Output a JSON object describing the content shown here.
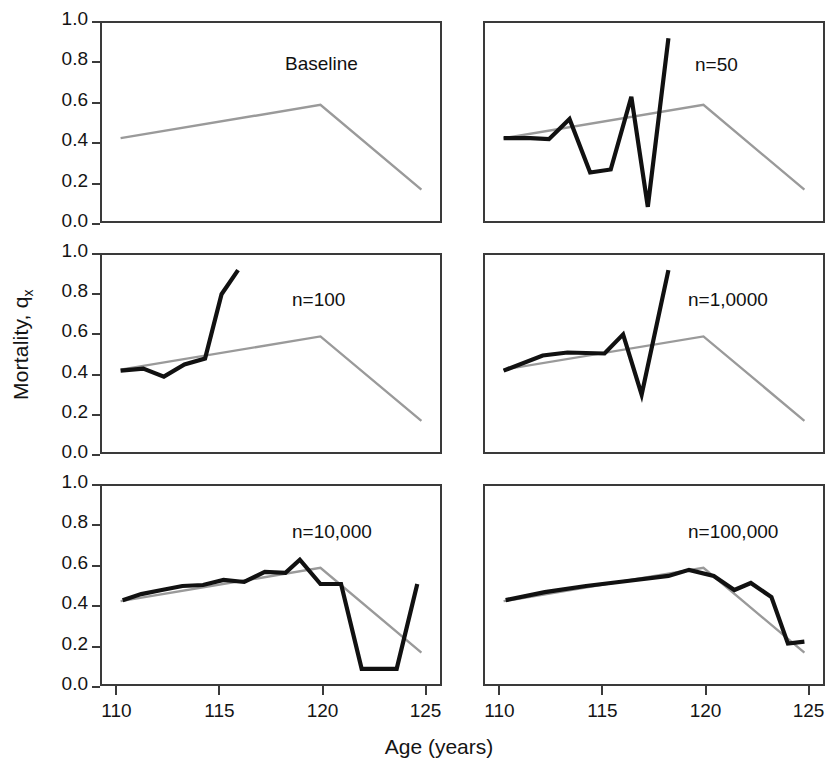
{
  "figure": {
    "xlabel": "Age (years)",
    "ylabel_main": "Mortality, q",
    "ylabel_sub": "x",
    "baseline_color": "#9a9a9a",
    "simulated_color": "#111111",
    "frame_color": "#3a3a3a",
    "background": "#ffffff"
  },
  "axes": {
    "xlim": [
      109.2,
      125.8
    ],
    "ylim": [
      0.0,
      1.0
    ],
    "xticks": [
      110,
      115,
      120,
      125
    ],
    "xtick_labels": [
      "110",
      "115",
      "120",
      "125"
    ],
    "yticks": [
      0.0,
      0.2,
      0.4,
      0.6,
      0.8,
      1.0
    ],
    "ytick_labels": [
      "0.0",
      "0.2",
      "0.4",
      "0.6",
      "0.8",
      "1.0"
    ],
    "grid": false
  },
  "chart_data": {
    "type": "line",
    "title": "",
    "xlabel": "Age (years)",
    "ylabel": "Mortality, qx",
    "xlim": [
      109.2,
      125.8
    ],
    "ylim": [
      0.0,
      1.0
    ],
    "legend_position": "none",
    "shared_baseline": {
      "name": "Baseline",
      "color": "#9a9a9a",
      "x": [
        110.2,
        119.9,
        124.8
      ],
      "y": [
        0.42,
        0.585,
        0.165
      ]
    },
    "panels": [
      {
        "id": "baseline",
        "label": "Baseline",
        "row": 1,
        "col": 1,
        "label_x_frac": 0.54,
        "label_y_frac": 0.16,
        "series": [
          {
            "name": "Baseline",
            "color": "#9a9a9a",
            "x": [
              110.2,
              119.9,
              124.8
            ],
            "y": [
              0.42,
              0.585,
              0.165
            ]
          }
        ]
      },
      {
        "id": "n50",
        "label": "n=50",
        "row": 1,
        "col": 2,
        "label_x_frac": 0.62,
        "label_y_frac": 0.165,
        "series": [
          {
            "name": "Baseline",
            "color": "#9a9a9a",
            "x": [
              110.2,
              119.9,
              124.8
            ],
            "y": [
              0.42,
              0.585,
              0.165
            ]
          },
          {
            "name": "Simulated",
            "color": "#111111",
            "x": [
              110.2,
              111.5,
              112.4,
              113.4,
              114.4,
              115.4,
              116.4,
              117.2,
              118.2
            ],
            "y": [
              0.42,
              0.42,
              0.415,
              0.515,
              0.25,
              0.265,
              0.625,
              0.08,
              0.915
            ]
          }
        ]
      },
      {
        "id": "n100",
        "label": "n=100",
        "row": 2,
        "col": 1,
        "label_x_frac": 0.56,
        "label_y_frac": 0.18,
        "series": [
          {
            "name": "Baseline",
            "color": "#9a9a9a",
            "x": [
              110.2,
              119.9,
              124.8
            ],
            "y": [
              0.42,
              0.585,
              0.165
            ]
          },
          {
            "name": "Simulated",
            "color": "#111111",
            "x": [
              110.2,
              111.3,
              112.3,
              113.3,
              114.3,
              115.1,
              115.9
            ],
            "y": [
              0.415,
              0.425,
              0.385,
              0.445,
              0.475,
              0.795,
              0.915
            ]
          }
        ]
      },
      {
        "id": "n10000-typo",
        "label": "n=1,0000",
        "row": 2,
        "col": 2,
        "label_x_frac": 0.6,
        "label_y_frac": 0.18,
        "series": [
          {
            "name": "Baseline",
            "color": "#9a9a9a",
            "x": [
              110.2,
              119.9,
              124.8
            ],
            "y": [
              0.42,
              0.585,
              0.165
            ]
          },
          {
            "name": "Simulated",
            "color": "#111111",
            "x": [
              110.2,
              112.1,
              113.3,
              115.1,
              116.0,
              116.9,
              118.2
            ],
            "y": [
              0.415,
              0.49,
              0.505,
              0.5,
              0.595,
              0.295,
              0.915
            ]
          }
        ]
      },
      {
        "id": "n10000",
        "label": "n=10,000",
        "row": 3,
        "col": 1,
        "label_x_frac": 0.56,
        "label_y_frac": 0.185,
        "series": [
          {
            "name": "Baseline",
            "color": "#9a9a9a",
            "x": [
              110.2,
              119.9,
              124.8
            ],
            "y": [
              0.42,
              0.585,
              0.165
            ]
          },
          {
            "name": "Simulated",
            "color": "#111111",
            "x": [
              110.3,
              111.2,
              112.2,
              113.2,
              114.2,
              115.2,
              116.2,
              117.2,
              118.2,
              118.9,
              119.9,
              120.9,
              121.9,
              123.6,
              124.6
            ],
            "y": [
              0.425,
              0.455,
              0.475,
              0.495,
              0.5,
              0.525,
              0.515,
              0.565,
              0.56,
              0.625,
              0.505,
              0.505,
              0.085,
              0.085,
              0.505
            ]
          }
        ]
      },
      {
        "id": "n100000",
        "label": "n=100,000",
        "row": 3,
        "col": 2,
        "label_x_frac": 0.6,
        "label_y_frac": 0.185,
        "series": [
          {
            "name": "Baseline",
            "color": "#9a9a9a",
            "x": [
              110.2,
              119.9,
              124.8
            ],
            "y": [
              0.42,
              0.585,
              0.165
            ]
          },
          {
            "name": "Simulated",
            "color": "#111111",
            "x": [
              110.3,
              112.2,
              114.2,
              116.2,
              118.2,
              119.2,
              120.4,
              121.4,
              122.2,
              123.2,
              124.0,
              124.8
            ],
            "y": [
              0.425,
              0.465,
              0.495,
              0.52,
              0.545,
              0.575,
              0.545,
              0.475,
              0.51,
              0.44,
              0.21,
              0.22
            ]
          }
        ]
      }
    ]
  }
}
